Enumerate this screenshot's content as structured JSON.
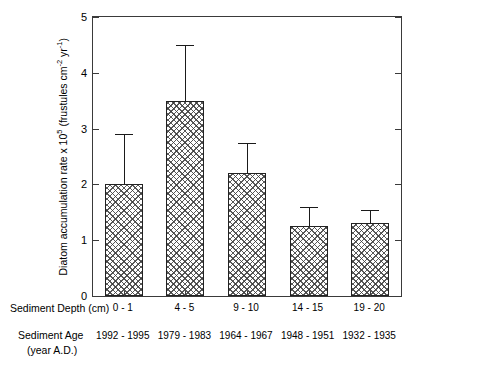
{
  "chart_data": {
    "type": "bar",
    "title": "",
    "xlabel": "Sediment Depth (cm)",
    "ylabel": "Diatom accumulation rate x 10^5 (frustules cm^-2 yr^-1)",
    "ylabel_parts": {
      "main": "Diatom accumulation rate x 10",
      "exp1": "5",
      "unit_open": " (frustules cm",
      "exp2": "-2",
      "unit_mid": " yr",
      "exp3": "-1",
      "unit_close": ")"
    },
    "categories": [
      "0 - 1",
      "4 - 5",
      "9 - 10",
      "14 - 15",
      "19 - 20"
    ],
    "secondary_categories": [
      "1992 - 1995",
      "1979 - 1983",
      "1964 - 1967",
      "1948 - 1951",
      "1932 - 1935"
    ],
    "values": [
      2.0,
      3.5,
      2.2,
      1.25,
      1.3
    ],
    "errors_upper": [
      0.9,
      1.0,
      0.55,
      0.35,
      0.25
    ],
    "ylim": [
      0,
      5
    ],
    "yticks": [
      0,
      1,
      2,
      3,
      4,
      5
    ],
    "ytick_labels": [
      "0",
      "1",
      "2",
      "3",
      "4",
      "5"
    ],
    "grid": false,
    "legend": false,
    "bar_fill": "crosshatch-gray",
    "bar_edge_color": "#222222",
    "axis_color": "#3a3a3a"
  },
  "axes": {
    "depth_row_label": "Sediment Depth (cm)",
    "age_row_label_line1": "Sediment Age",
    "age_row_label_line2": "(year A.D.)"
  }
}
